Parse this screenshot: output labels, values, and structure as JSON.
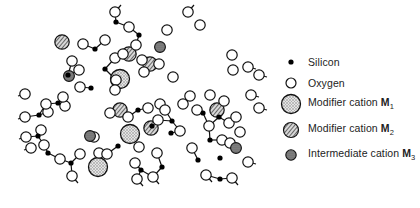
{
  "legend": {
    "items": [
      {
        "key": "silicon",
        "label": "Silicon",
        "symbol": "small-black-dot"
      },
      {
        "key": "oxygen",
        "label": "Oxygen",
        "symbol": "open-circle"
      },
      {
        "key": "m1",
        "label": "Modifier cation ",
        "ion": "M",
        "sub": "1",
        "symbol": "large-stippled-circle"
      },
      {
        "key": "m2",
        "label": "Modifier cation ",
        "ion": "M",
        "sub": "2",
        "symbol": "hatched-circle"
      },
      {
        "key": "m3",
        "label": "Intermediate cation ",
        "ion": "M",
        "sub": "3",
        "symbol": "small-dark-stippled-circle"
      }
    ]
  },
  "colors": {
    "line": "#111111",
    "oxygen_fill": "#ffffff",
    "silicon_fill": "#000000",
    "m1_fill": "#c8c8c8",
    "m2_fill": "#9a9a9a",
    "m3_fill": "#7a7a7a"
  },
  "network": {
    "silicon": [
      [
        116,
        22
      ],
      [
        139,
        35
      ],
      [
        95,
        49
      ],
      [
        105,
        69
      ],
      [
        68,
        75
      ],
      [
        91,
        88
      ],
      [
        58,
        103
      ],
      [
        39,
        115
      ],
      [
        38,
        136
      ],
      [
        48,
        153
      ],
      [
        71,
        163
      ],
      [
        118,
        146
      ],
      [
        138,
        110
      ],
      [
        152,
        126
      ],
      [
        172,
        121
      ],
      [
        171,
        133
      ],
      [
        203,
        113
      ],
      [
        210,
        140
      ],
      [
        220,
        158
      ],
      [
        198,
        160
      ],
      [
        141,
        170
      ],
      [
        162,
        167
      ],
      [
        219,
        117
      ],
      [
        220,
        179
      ]
    ],
    "oxygen": [
      [
        115,
        12
      ],
      [
        129,
        27
      ],
      [
        83,
        44
      ],
      [
        105,
        40
      ],
      [
        115,
        58
      ],
      [
        116,
        80
      ],
      [
        72,
        61
      ],
      [
        79,
        70
      ],
      [
        80,
        87
      ],
      [
        65,
        106
      ],
      [
        48,
        112
      ],
      [
        63,
        97
      ],
      [
        46,
        104
      ],
      [
        26,
        137
      ],
      [
        41,
        130
      ],
      [
        44,
        145
      ],
      [
        60,
        159
      ],
      [
        72,
        176
      ],
      [
        80,
        154
      ],
      [
        94,
        137
      ],
      [
        99,
        153
      ],
      [
        107,
        154
      ],
      [
        110,
        113
      ],
      [
        128,
        117
      ],
      [
        148,
        108
      ],
      [
        158,
        120
      ],
      [
        160,
        104
      ],
      [
        165,
        110
      ],
      [
        139,
        147
      ],
      [
        135,
        163
      ],
      [
        157,
        153
      ],
      [
        180,
        131
      ],
      [
        183,
        104
      ],
      [
        190,
        96
      ],
      [
        210,
        95
      ],
      [
        197,
        110
      ],
      [
        209,
        126
      ],
      [
        224,
        101
      ],
      [
        229,
        123
      ],
      [
        192,
        148
      ],
      [
        222,
        140
      ],
      [
        230,
        143
      ],
      [
        248,
        162
      ],
      [
        206,
        175
      ],
      [
        232,
        178
      ],
      [
        137,
        179
      ],
      [
        153,
        177
      ],
      [
        31,
        148
      ],
      [
        25,
        117
      ],
      [
        25,
        94
      ],
      [
        142,
        60
      ],
      [
        123,
        54
      ],
      [
        136,
        45
      ],
      [
        144,
        72
      ],
      [
        115,
        90
      ],
      [
        159,
        64
      ],
      [
        173,
        77
      ],
      [
        167,
        30
      ],
      [
        188,
        12
      ],
      [
        200,
        25
      ],
      [
        232,
        55
      ],
      [
        233,
        70
      ],
      [
        248,
        67
      ],
      [
        251,
        95
      ],
      [
        259,
        108
      ],
      [
        259,
        75
      ],
      [
        236,
        117
      ],
      [
        240,
        132
      ]
    ],
    "m1": [
      [
        120,
        79
      ],
      [
        98,
        167
      ],
      [
        130,
        134
      ]
    ],
    "m2": [
      [
        62,
        42
      ],
      [
        129,
        54
      ],
      [
        120,
        110
      ],
      [
        150,
        64
      ],
      [
        151,
        128
      ],
      [
        217,
        110
      ]
    ],
    "m3": [
      [
        69,
        76
      ],
      [
        160,
        47
      ],
      [
        90,
        136
      ],
      [
        236,
        148
      ]
    ],
    "bonds": [
      [
        [
          115,
          12
        ],
        [
          116,
          22
        ]
      ],
      [
        [
          116,
          22
        ],
        [
          105,
          40
        ]
      ],
      [
        [
          116,
          22
        ],
        [
          129,
          27
        ]
      ],
      [
        [
          129,
          27
        ],
        [
          139,
          35
        ]
      ],
      [
        [
          139,
          35
        ],
        [
          136,
          45
        ]
      ],
      [
        [
          139,
          35
        ],
        [
          142,
          20
        ]
      ],
      [
        [
          83,
          44
        ],
        [
          95,
          49
        ]
      ],
      [
        [
          95,
          49
        ],
        [
          105,
          40
        ]
      ],
      [
        [
          95,
          49
        ],
        [
          115,
          58
        ]
      ],
      [
        [
          115,
          58
        ],
        [
          105,
          69
        ]
      ],
      [
        [
          105,
          69
        ],
        [
          116,
          80
        ]
      ],
      [
        [
          105,
          69
        ],
        [
          79,
          70
        ]
      ],
      [
        [
          79,
          70
        ],
        [
          68,
          75
        ]
      ],
      [
        [
          68,
          75
        ],
        [
          72,
          61
        ]
      ],
      [
        [
          72,
          61
        ],
        [
          58,
          65
        ]
      ],
      [
        [
          68,
          75
        ],
        [
          80,
          87
        ]
      ],
      [
        [
          80,
          87
        ],
        [
          91,
          88
        ]
      ],
      [
        [
          91,
          88
        ],
        [
          115,
          90
        ]
      ],
      [
        [
          91,
          88
        ],
        [
          93,
          100
        ]
      ],
      [
        [
          63,
          97
        ],
        [
          58,
          103
        ]
      ],
      [
        [
          58,
          103
        ],
        [
          46,
          104
        ]
      ],
      [
        [
          58,
          103
        ],
        [
          48,
          112
        ]
      ],
      [
        [
          48,
          112
        ],
        [
          39,
          115
        ]
      ],
      [
        [
          39,
          115
        ],
        [
          25,
          117
        ]
      ],
      [
        [
          39,
          115
        ],
        [
          41,
          130
        ]
      ],
      [
        [
          41,
          130
        ],
        [
          38,
          136
        ]
      ],
      [
        [
          38,
          136
        ],
        [
          26,
          137
        ]
      ],
      [
        [
          38,
          136
        ],
        [
          44,
          145
        ]
      ],
      [
        [
          44,
          145
        ],
        [
          48,
          153
        ]
      ],
      [
        [
          48,
          153
        ],
        [
          31,
          148
        ]
      ],
      [
        [
          48,
          153
        ],
        [
          60,
          159
        ]
      ],
      [
        [
          60,
          159
        ],
        [
          71,
          163
        ]
      ],
      [
        [
          71,
          163
        ],
        [
          80,
          154
        ]
      ],
      [
        [
          71,
          163
        ],
        [
          72,
          176
        ]
      ],
      [
        [
          80,
          154
        ],
        [
          94,
          137
        ]
      ],
      [
        [
          94,
          137
        ],
        [
          110,
          113
        ]
      ]
    ]
  }
}
